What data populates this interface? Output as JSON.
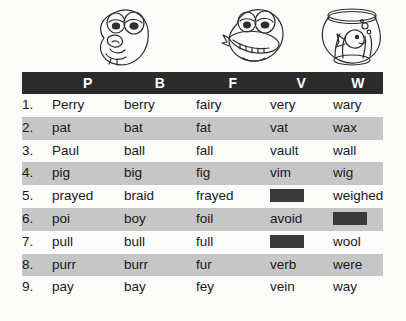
{
  "illustrations": [
    {
      "name": "pondering-face",
      "alt": "pondering cartoon face"
    },
    {
      "name": "grinning-face",
      "alt": "grinning cartoon face with teeth"
    },
    {
      "name": "fishbowl",
      "alt": "fish in a fishbowl"
    }
  ],
  "table": {
    "headers": {
      "number": "",
      "columns": [
        "P",
        "B",
        "F",
        "V",
        "W"
      ]
    },
    "rows": [
      {
        "num": "1.",
        "p": "Perry",
        "b": "berry",
        "f": "fairy",
        "v": "very",
        "w": "wary"
      },
      {
        "num": "2.",
        "p": "pat",
        "b": "bat",
        "f": "fat",
        "v": "vat",
        "w": "wax"
      },
      {
        "num": "3.",
        "p": "Paul",
        "b": "ball",
        "f": "fall",
        "v": "vault",
        "w": "wall"
      },
      {
        "num": "4.",
        "p": "pig",
        "b": "big",
        "f": "fig",
        "v": "vim",
        "w": "wig"
      },
      {
        "num": "5.",
        "p": "prayed",
        "b": "braid",
        "f": "frayed",
        "v": "",
        "w": "weighed"
      },
      {
        "num": "6.",
        "p": "poi",
        "b": "boy",
        "f": "foil",
        "v": "avoid",
        "w": ""
      },
      {
        "num": "7.",
        "p": "pull",
        "b": "bull",
        "f": "full",
        "v": "",
        "w": "wool"
      },
      {
        "num": "8.",
        "p": "purr",
        "b": "burr",
        "f": "fur",
        "v": "verb",
        "w": "were"
      },
      {
        "num": "9.",
        "p": "pay",
        "b": "bay",
        "f": "fey",
        "v": "vein",
        "w": "way"
      }
    ],
    "redacted_cells": [
      {
        "row": 5,
        "column": "V"
      },
      {
        "row": 6,
        "column": "W"
      },
      {
        "row": 7,
        "column": "V"
      }
    ]
  },
  "colors": {
    "header_background": "#2b2b2b",
    "header_text": "#ffffff",
    "stripe_even": "#c6c6c6",
    "stripe_odd": "#fbfbfa",
    "redaction": "#3a3a3a",
    "page_background": "#fbfbfa",
    "body_text": "#1a1a1a"
  }
}
